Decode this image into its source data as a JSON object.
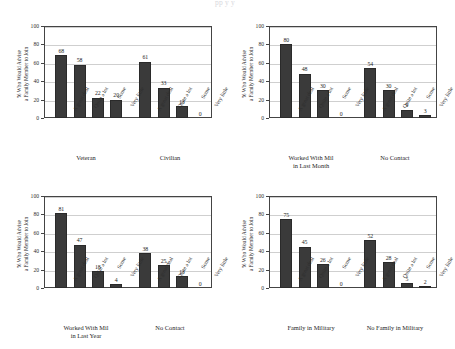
{
  "figure": {
    "faint_header": "pp  y  y",
    "y_axis_label_line1": "% Who Would Advise",
    "y_axis_label_line2": "a Family Member to Join",
    "categories": [
      "A great deal",
      "Quite a lot",
      "Some",
      "Very little"
    ],
    "y_ticks": [
      "0",
      "20",
      "40",
      "60",
      "80",
      "100"
    ]
  },
  "chart_data": [
    {
      "type": "bar",
      "panel": "top-left",
      "title": "",
      "xlabel": "",
      "ylabel": "% Who Would Advise a Family Member to Join",
      "ylim": [
        0,
        100
      ],
      "grid": true,
      "categories": [
        "A great deal",
        "Quite a lot",
        "Some",
        "Very little"
      ],
      "groups": [
        {
          "name": "Veteran",
          "name_line2": "",
          "values": [
            68,
            58,
            22,
            20
          ]
        },
        {
          "name": "Civilian",
          "name_line2": "",
          "values": [
            61,
            33,
            13,
            0
          ]
        }
      ]
    },
    {
      "type": "bar",
      "panel": "top-right",
      "title": "",
      "xlabel": "",
      "ylabel": "% Who Would Advise a Family Member to Join",
      "ylim": [
        0,
        100
      ],
      "grid": true,
      "categories": [
        "A great deal",
        "Quite a lot",
        "Some",
        "Very little"
      ],
      "groups": [
        {
          "name": "Worked With Mil",
          "name_line2": "in Last Month",
          "values": [
            80,
            48,
            30,
            0
          ]
        },
        {
          "name": "No Contact",
          "name_line2": "",
          "values": [
            54,
            30,
            9,
            3
          ]
        }
      ]
    },
    {
      "type": "bar",
      "panel": "bottom-left",
      "title": "",
      "xlabel": "",
      "ylabel": "% Who Would Advise a Family Member to Join",
      "ylim": [
        0,
        100
      ],
      "grid": true,
      "categories": [
        "A great deal",
        "Quite a lot",
        "Some",
        "Very little"
      ],
      "groups": [
        {
          "name": "Worked With Mil",
          "name_line2": "in Last Year",
          "values": [
            81,
            47,
            18,
            4
          ]
        },
        {
          "name": "No Contact",
          "name_line2": "",
          "values": [
            38,
            25,
            13,
            0
          ]
        }
      ]
    },
    {
      "type": "bar",
      "panel": "bottom-right",
      "title": "",
      "xlabel": "",
      "ylabel": "% Who Would Advise a Family Member to Join",
      "ylim": [
        0,
        100
      ],
      "grid": true,
      "categories": [
        "A great deal",
        "Quite a lot",
        "Some",
        "Very little"
      ],
      "groups": [
        {
          "name": "Family in Military",
          "name_line2": "",
          "values": [
            75,
            45,
            26,
            0
          ]
        },
        {
          "name": "No Family in Military",
          "name_line2": "",
          "values": [
            52,
            28,
            5,
            2
          ]
        }
      ]
    }
  ],
  "style": {
    "bar_color": "#3a3a3a",
    "grid_color": "#cfcfcf",
    "axis_color": "#444444",
    "text_color": "#2b2b2b"
  }
}
